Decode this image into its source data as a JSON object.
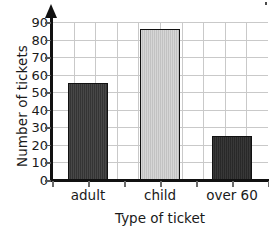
{
  "chart_data": {
    "type": "bar",
    "title": "",
    "subtitle": "",
    "categories": [
      "adult",
      "child",
      "over 60"
    ],
    "values": [
      55,
      86,
      25
    ],
    "series": [
      {
        "name": "Number of tickets",
        "values": [
          55,
          86,
          25
        ]
      }
    ],
    "xlabel": "Type of ticket",
    "ylabel": "Number of tickets",
    "ylim": [
      0,
      90
    ],
    "xlim": null,
    "ytick_labels": [
      "0",
      "10",
      "20",
      "30",
      "40",
      "50",
      "60",
      "70",
      "80",
      "90"
    ],
    "ytick_values": [
      0,
      10,
      20,
      30,
      40,
      50,
      60,
      70,
      80,
      90
    ],
    "grid": "both",
    "legend": "none",
    "annotations": [],
    "bar_colors": [
      "#3a3a3a",
      "#c8c8c8",
      "#2e2e2e"
    ],
    "bar_edge_color": "#111111",
    "axis_color": "#111111",
    "grid_color": "#c9c9c9",
    "background_color": "#ffffff"
  },
  "axes": {
    "y_axis_name": "y-axis",
    "x_axis_name": "x-axis",
    "y_arrow": "arrow-head-up"
  }
}
